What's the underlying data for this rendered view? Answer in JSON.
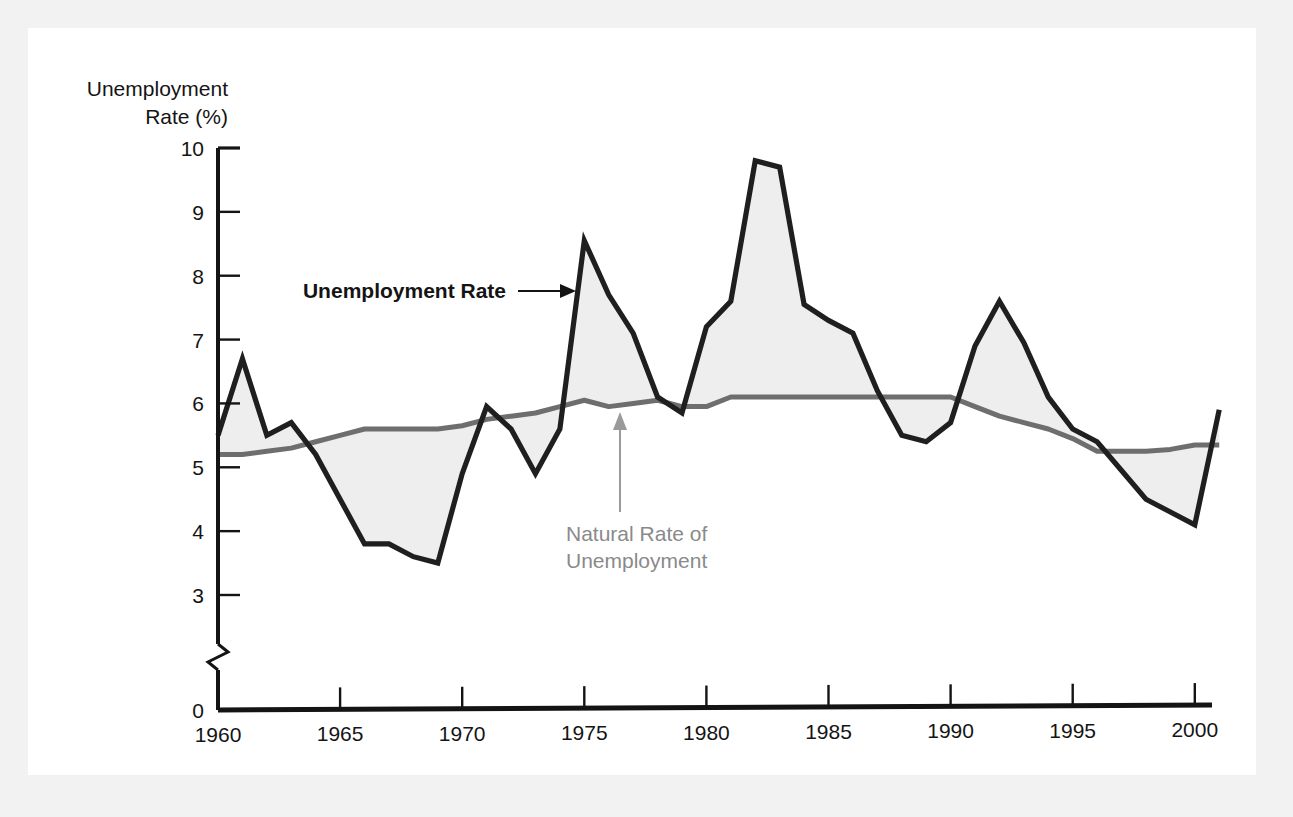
{
  "figure": {
    "background_color": "#f2f2f2",
    "canvas_color": "#ffffff"
  },
  "axis": {
    "y_title_line1": "Unemployment",
    "y_title_line2": "Rate (%)",
    "y_ticks": [
      "10",
      "9",
      "8",
      "7",
      "6",
      "5",
      "4",
      "3",
      "0"
    ],
    "x_ticks": [
      "1960",
      "1965",
      "1970",
      "1975",
      "1980",
      "1985",
      "1990",
      "1995",
      "2000"
    ],
    "has_axis_break": true
  },
  "annotations": {
    "actual_label": "Unemployment Rate",
    "natural_label_line1": "Natural Rate of",
    "natural_label_line2": "Unemployment"
  },
  "colors": {
    "actual_series": "#1f1f1f",
    "natural_series": "#6e6e6e",
    "gap_fill": "#eeeeee",
    "axis": "#141414",
    "natural_label": "#8a8a8a"
  },
  "chart_data": {
    "type": "line",
    "title": "",
    "xlabel": "",
    "ylabel": "Unemployment Rate (%)",
    "xlim": [
      1960,
      2001
    ],
    "ylim": [
      3,
      10
    ],
    "grid": false,
    "legend": "annotated-inline",
    "axis_break_below": 3,
    "x": [
      1960,
      1961,
      1962,
      1963,
      1964,
      1965,
      1966,
      1967,
      1968,
      1969,
      1970,
      1971,
      1972,
      1973,
      1974,
      1975,
      1976,
      1977,
      1978,
      1979,
      1980,
      1981,
      1982,
      1983,
      1984,
      1985,
      1986,
      1987,
      1988,
      1989,
      1990,
      1991,
      1992,
      1993,
      1994,
      1995,
      1996,
      1997,
      1998,
      1999,
      2000,
      2001
    ],
    "series": [
      {
        "name": "Unemployment Rate",
        "color": "#1f1f1f",
        "values": [
          5.5,
          6.7,
          5.5,
          5.7,
          5.2,
          4.5,
          3.8,
          3.8,
          3.6,
          3.5,
          4.9,
          5.95,
          5.6,
          4.9,
          5.6,
          8.55,
          7.7,
          7.1,
          6.1,
          5.85,
          7.2,
          7.6,
          9.8,
          9.7,
          7.55,
          7.3,
          7.1,
          6.2,
          5.5,
          5.4,
          5.7,
          6.9,
          7.6,
          6.95,
          6.1,
          5.6,
          5.4,
          4.95,
          4.5,
          4.3,
          4.1,
          5.9
        ]
      },
      {
        "name": "Natural Rate of Unemployment",
        "color": "#6e6e6e",
        "values": [
          5.2,
          5.2,
          5.25,
          5.3,
          5.4,
          5.5,
          5.6,
          5.6,
          5.6,
          5.6,
          5.65,
          5.75,
          5.8,
          5.85,
          5.95,
          6.05,
          5.95,
          6.0,
          6.05,
          5.95,
          5.95,
          6.1,
          6.1,
          6.1,
          6.1,
          6.1,
          6.1,
          6.1,
          6.1,
          6.1,
          6.1,
          5.95,
          5.8,
          5.7,
          5.6,
          5.45,
          5.25,
          5.25,
          5.25,
          5.28,
          5.35,
          5.35
        ]
      }
    ]
  }
}
